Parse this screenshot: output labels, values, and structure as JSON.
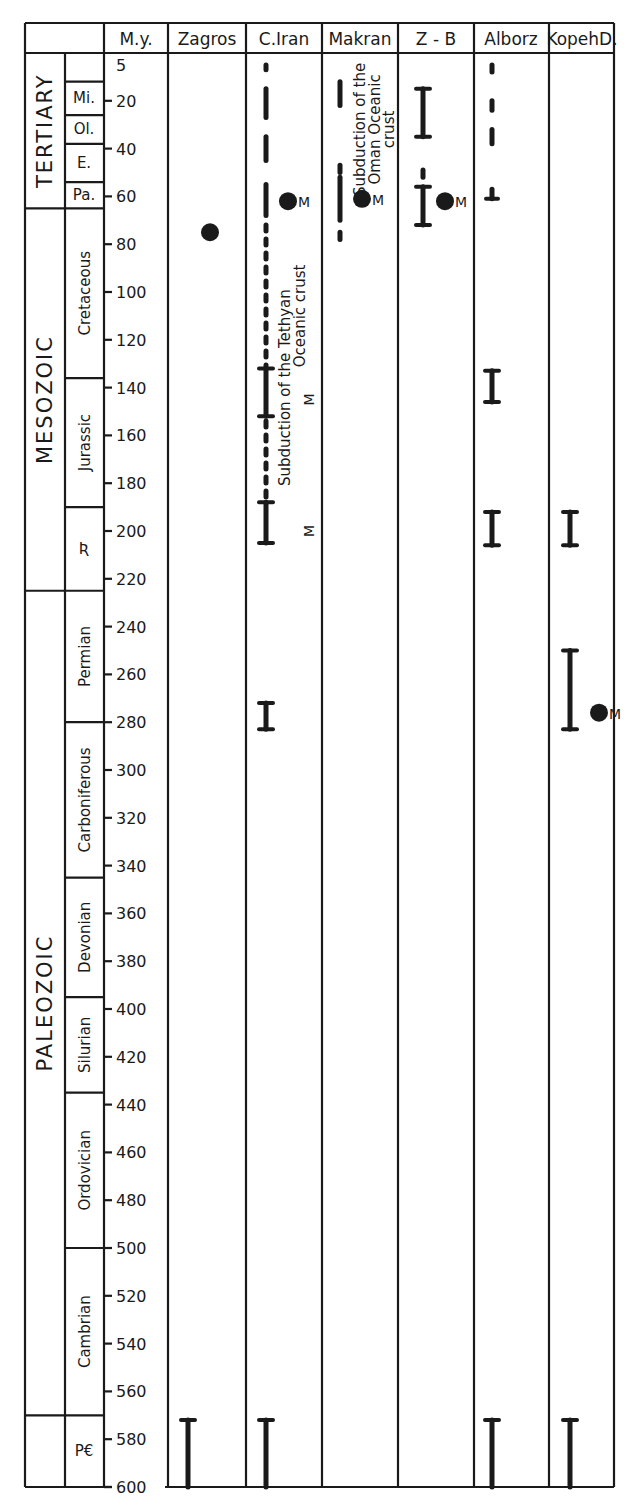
{
  "header": {
    "my_label": "M.y.",
    "columns": [
      "Zagros",
      "C.Iran",
      "Makran",
      "Z - B",
      "Alborz",
      "KopehD."
    ]
  },
  "eras": [
    {
      "label": "TERTIARY",
      "from": 0,
      "to": 65
    },
    {
      "label": "MESOZOIC",
      "from": 65,
      "to": 225
    },
    {
      "label": "PALEOZOIC",
      "from": 225,
      "to": 570
    },
    {
      "label": "",
      "from": 570,
      "to": 600
    }
  ],
  "periods": [
    {
      "label": "",
      "from": 0,
      "to": 12
    },
    {
      "label": "Mi.",
      "from": 12,
      "to": 26
    },
    {
      "label": "Ol.",
      "from": 26,
      "to": 38
    },
    {
      "label": "E.",
      "from": 38,
      "to": 54
    },
    {
      "label": "Pa.",
      "from": 54,
      "to": 65
    },
    {
      "label": "Cretaceous",
      "from": 65,
      "to": 136
    },
    {
      "label": "Jurassic",
      "from": 136,
      "to": 190
    },
    {
      "label": "Ʀ",
      "from": 190,
      "to": 225
    },
    {
      "label": "Permian",
      "from": 225,
      "to": 280
    },
    {
      "label": "Carboniferous",
      "from": 280,
      "to": 345
    },
    {
      "label": "Devonian",
      "from": 345,
      "to": 395
    },
    {
      "label": "Silurian",
      "from": 395,
      "to": 435
    },
    {
      "label": "Ordovician",
      "from": 435,
      "to": 500
    },
    {
      "label": "Cambrian",
      "from": 500,
      "to": 570
    },
    {
      "label": "P€",
      "from": 570,
      "to": 600
    }
  ],
  "chart_data": {
    "type": "table",
    "ylabel": "M.y.",
    "ylim": [
      0,
      600
    ],
    "y_ticks": [
      5,
      20,
      40,
      60,
      80,
      100,
      120,
      140,
      160,
      180,
      200,
      220,
      240,
      260,
      280,
      300,
      320,
      340,
      360,
      380,
      400,
      420,
      440,
      460,
      480,
      500,
      520,
      540,
      560,
      580,
      600
    ],
    "categories": [
      "Zagros",
      "C.Iran",
      "Makran",
      "Z - B",
      "Alborz",
      "KopehD."
    ],
    "series": [
      {
        "name": "Zagros",
        "ranges": [
          {
            "from": 572,
            "to": 600,
            "style": "solid"
          }
        ],
        "dots": [
          {
            "age": 75,
            "label": ""
          }
        ],
        "m_labels": []
      },
      {
        "name": "C.Iran",
        "ranges": [
          {
            "from": 5,
            "to": 7,
            "style": "dash"
          },
          {
            "from": 15,
            "to": 27,
            "style": "dash"
          },
          {
            "from": 35,
            "to": 45,
            "style": "dash"
          },
          {
            "from": 55,
            "to": 68,
            "style": "dash"
          },
          {
            "from": 72,
            "to": 132,
            "style": "dotted"
          },
          {
            "from": 132,
            "to": 152,
            "style": "solid"
          },
          {
            "from": 154,
            "to": 186,
            "style": "dotted"
          },
          {
            "from": 188,
            "to": 205,
            "style": "solid"
          },
          {
            "from": 272,
            "to": 283,
            "style": "solid"
          },
          {
            "from": 572,
            "to": 600,
            "style": "solid"
          }
        ],
        "dots": [
          {
            "age": 62,
            "label": "M"
          }
        ],
        "m_labels": [
          {
            "age": 145,
            "label": "M"
          },
          {
            "age": 200,
            "label": "M"
          }
        ],
        "annotation": "Subduction of the Tethyan Oceanic crust"
      },
      {
        "name": "Makran",
        "ranges": [
          {
            "from": 12,
            "to": 22,
            "style": "dash"
          },
          {
            "from": 47,
            "to": 50,
            "style": "dash"
          },
          {
            "from": 52,
            "to": 70,
            "style": "dash"
          },
          {
            "from": 75,
            "to": 78,
            "style": "dash"
          }
        ],
        "dots": [
          {
            "age": 61,
            "label": "M"
          }
        ],
        "m_labels": [],
        "annotation": "Subduction of the Oman Oceanic crust"
      },
      {
        "name": "Z - B",
        "ranges": [
          {
            "from": 15,
            "to": 35,
            "style": "solid"
          },
          {
            "from": 49,
            "to": 52,
            "style": "dash"
          },
          {
            "from": 56,
            "to": 72,
            "style": "solid"
          }
        ],
        "dots": [
          {
            "age": 62,
            "label": "M"
          }
        ],
        "m_labels": []
      },
      {
        "name": "Alborz",
        "ranges": [
          {
            "from": 5,
            "to": 8,
            "style": "dash"
          },
          {
            "from": 20,
            "to": 24,
            "style": "dash"
          },
          {
            "from": 32,
            "to": 38,
            "style": "dash"
          },
          {
            "from": 57,
            "to": 61,
            "style": "solid"
          },
          {
            "from": 133,
            "to": 146,
            "style": "solid"
          },
          {
            "from": 192,
            "to": 206,
            "style": "solid"
          },
          {
            "from": 572,
            "to": 600,
            "style": "solid"
          }
        ],
        "dots": [],
        "m_labels": []
      },
      {
        "name": "KopehD.",
        "ranges": [
          {
            "from": 192,
            "to": 206,
            "style": "solid"
          },
          {
            "from": 250,
            "to": 283,
            "style": "solid"
          },
          {
            "from": 572,
            "to": 600,
            "style": "solid"
          }
        ],
        "dots": [
          {
            "age": 276,
            "label": "M"
          }
        ],
        "m_labels": []
      }
    ]
  }
}
